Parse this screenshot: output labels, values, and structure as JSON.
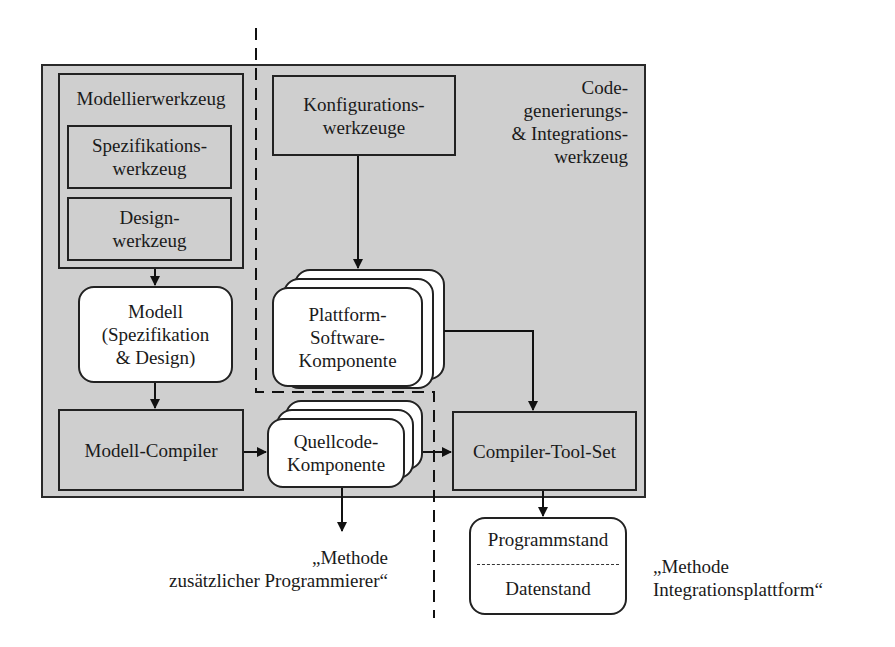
{
  "diagram": {
    "outer_panel": {
      "label_lines": [
        "Code-",
        "generierungs-",
        "& Integrations-",
        "werkzeug"
      ],
      "fill": "#cfcfcf"
    },
    "modellierwerkzeug": {
      "title": "Modellierwerkzeug",
      "spezifikation": {
        "line1": "Spezifikations-",
        "line2": "werkzeug"
      },
      "design": {
        "line1": "Design-",
        "line2": "werkzeug"
      }
    },
    "modell": {
      "line1": "Modell",
      "line2": "(Spezifikation",
      "line3": "& Design)"
    },
    "modell_compiler": {
      "label": "Modell-Compiler"
    },
    "konfigurationswerkzeuge": {
      "line1": "Konfigurations-",
      "line2": "werkzeuge"
    },
    "plattform_komponente": {
      "line1": "Plattform-",
      "line2": "Software-",
      "line3": "Komponente"
    },
    "quellcode_komponente": {
      "line1": "Quellcode-",
      "line2": "Komponente"
    },
    "compiler_tool_set": {
      "label": "Compiler-Tool-Set"
    },
    "output_box": {
      "top": "Programmstand",
      "bottom": "Datenstand"
    },
    "method_labels": {
      "programmierer": {
        "line1": "„Methode",
        "line2": "zusätzlicher Programmierer“"
      },
      "integrationsplattform": {
        "line1": "„Methode",
        "line2": "Integrationsplattform“"
      }
    }
  }
}
